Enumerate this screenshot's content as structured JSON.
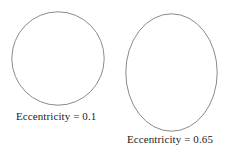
{
  "figure": {
    "background_color": "#ffffff",
    "stroke_color": "#7d7d7d",
    "text_color": "#1c1c1c",
    "shapes": [
      {
        "name": "low-eccentricity-ellipse",
        "eccentricity": 0.1,
        "caption": "Eccentricity = 0.1",
        "width_px": 92,
        "height_px": 93
      },
      {
        "name": "high-eccentricity-ellipse",
        "eccentricity": 0.65,
        "caption": "Eccentricity = 0.65",
        "width_px": 91,
        "height_px": 117
      }
    ]
  }
}
